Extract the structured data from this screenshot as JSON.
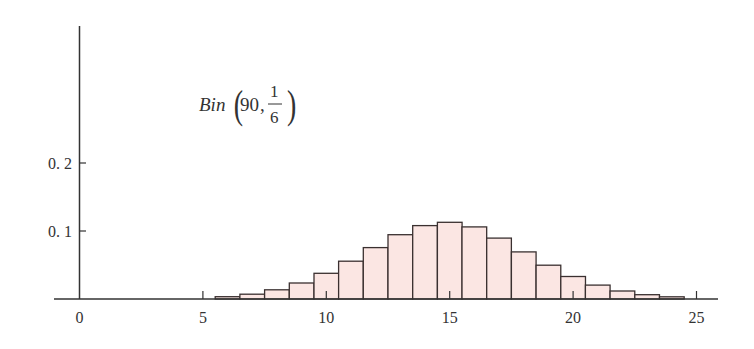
{
  "chart_data": {
    "type": "bar",
    "title": "",
    "annotation": {
      "name": "Bin",
      "n": "90",
      "p_num": "1",
      "p_den": "6"
    },
    "xlabel": "",
    "ylabel": "",
    "x_ticks": [
      "0",
      "5",
      "10",
      "15",
      "20",
      "25"
    ],
    "y_ticks": [
      "0.1",
      "0.2"
    ],
    "xlim": [
      0,
      26
    ],
    "ylim": [
      0,
      0.4
    ],
    "grid": false,
    "categories": [
      6,
      7,
      8,
      9,
      10,
      11,
      12,
      13,
      14,
      15,
      16,
      17,
      18,
      19,
      20,
      21,
      22,
      23,
      24
    ],
    "values": [
      0.0034,
      0.0071,
      0.0135,
      0.0236,
      0.0378,
      0.0556,
      0.0756,
      0.0945,
      0.108,
      0.1128,
      0.106,
      0.0895,
      0.0693,
      0.0497,
      0.0331,
      0.0205,
      0.0118,
      0.0063,
      0.0032
    ],
    "colors": {
      "bar_fill": "#fbe6e3",
      "bar_stroke": "#3a3030",
      "axis": "#333333"
    }
  }
}
